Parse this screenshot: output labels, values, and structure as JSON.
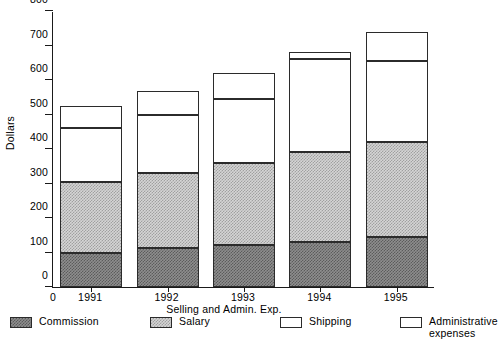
{
  "chart_data": {
    "type": "bar",
    "subtype": "stacked",
    "title": "",
    "xlabel": "Selling and Admin. Exp.",
    "ylabel": "Dollars",
    "categories": [
      "1991",
      "1992",
      "1993",
      "1994",
      "1995"
    ],
    "ylim": [
      0,
      800
    ],
    "yticks": [
      0,
      100,
      200,
      300,
      400,
      500,
      600,
      700,
      800
    ],
    "ytick_labels": [
      "0",
      "100",
      "200",
      "300",
      "400",
      "500",
      "600",
      "700",
      "800"
    ],
    "xtick_origin_label": "0",
    "grid": false,
    "legend_position": "bottom",
    "series": [
      {
        "name": "Commission",
        "color": "#8e8e8e",
        "pattern": "dark-checker",
        "values": [
          100,
          112,
          122,
          130,
          145
        ]
      },
      {
        "name": "Salary",
        "color": "#d5d5d5",
        "pattern": "light-checker",
        "values": [
          205,
          218,
          238,
          260,
          275
        ]
      },
      {
        "name": "Shipping",
        "color": "#ffffff",
        "pattern": "solid-white",
        "values": [
          155,
          170,
          185,
          272,
          235
        ]
      },
      {
        "name": "Administrative\nexpenses",
        "color": "#ffffff",
        "pattern": "solid-white",
        "values": [
          65,
          67,
          75,
          18,
          85
        ]
      }
    ],
    "totals": [
      525,
      567,
      620,
      680,
      740
    ]
  },
  "legend": {
    "items": [
      {
        "label": "Commission"
      },
      {
        "label": "Salary"
      },
      {
        "label": "Shipping"
      },
      {
        "label": "Administrative\nexpenses"
      }
    ]
  },
  "axis": {
    "y_title": "Dollars",
    "x_title": "Selling and Admin. Exp."
  }
}
